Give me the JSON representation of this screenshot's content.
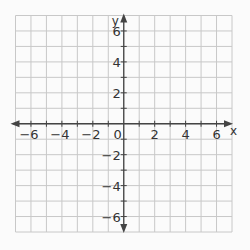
{
  "chart_data": {
    "type": "scatter",
    "title": "",
    "xlabel": "x",
    "ylabel": "y",
    "xlim": [
      -7,
      7
    ],
    "ylim": [
      -7,
      7
    ],
    "grid": true,
    "grid_step": 1,
    "x_tick_labels": [
      "-6",
      "-4",
      "-2",
      "0",
      "2",
      "4",
      "6"
    ],
    "x_tick_values": [
      -6,
      -4,
      -2,
      0,
      2,
      4,
      6
    ],
    "y_tick_labels": [
      "6",
      "4",
      "2",
      "-2",
      "-4",
      "-6"
    ],
    "y_tick_values": [
      6,
      4,
      2,
      -2,
      -4,
      -6
    ],
    "origin_label": "0",
    "series": [],
    "legend": null
  },
  "colors": {
    "background": "#fbfbfb",
    "grid": "#c8c8c8",
    "axis": "#444444",
    "text": "#333333"
  }
}
